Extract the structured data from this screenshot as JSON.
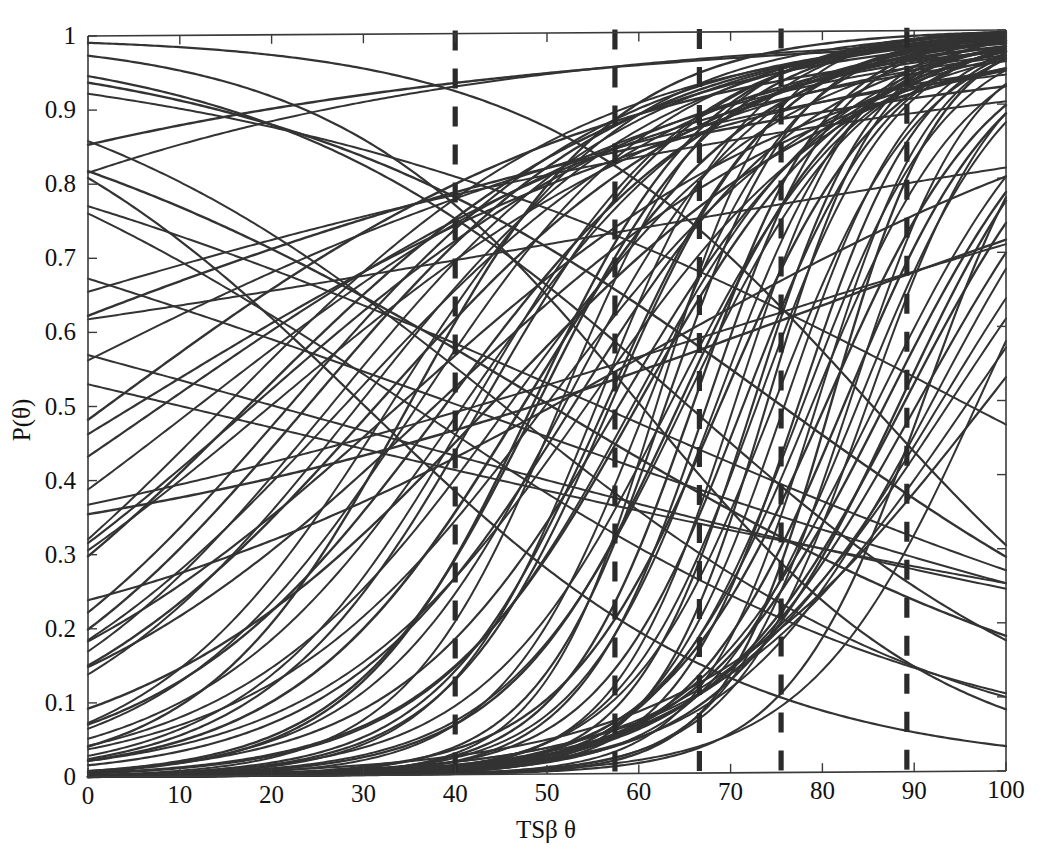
{
  "figure": {
    "name": "item-characteristic-curves",
    "background_color": "#ffffff",
    "curve_color": "#333333",
    "axis_color": "#3a3a3a",
    "cut_line_color": "#2b2b2b"
  },
  "chart_data": {
    "type": "line",
    "title": "",
    "subtitle": "",
    "xlabel": "TSβ θ",
    "ylabel": "P(θ)",
    "xlim": [
      0,
      100
    ],
    "ylim": [
      0,
      1
    ],
    "grid": false,
    "legend": "none",
    "xticks": [
      0,
      10,
      20,
      30,
      40,
      50,
      60,
      70,
      80,
      90,
      100
    ],
    "xticklabels": [
      "0",
      "10",
      "20",
      "30",
      "40",
      "50",
      "60",
      "70",
      "80",
      "90",
      "100"
    ],
    "yticks": [
      0,
      0.1,
      0.2,
      0.3,
      0.4,
      0.5,
      0.6,
      0.7,
      0.8,
      0.9,
      1
    ],
    "yticklabels": [
      "0",
      "0.1",
      "0.2",
      "0.3",
      "0.4",
      "0.5",
      "0.6",
      "0.7",
      "0.8",
      "0.9",
      "1"
    ],
    "annotations": {
      "cut_score_lines": {
        "label": "vertical dashed cut-score lines",
        "x_values": [
          40.0,
          57.4,
          66.6,
          75.5,
          89.2
        ],
        "style": "dashed",
        "color": "#2b2b2b"
      }
    },
    "series_note": "Each series is a two-parameter logistic item characteristic curve P(theta)=c+(1-c)/(1+exp(-a*(theta-b))) over theta in [0,100].",
    "series": [
      {
        "name": "item-1",
        "a": 0.057,
        "b": 22.0,
        "c": 0.0,
        "lw": 2.2
      },
      {
        "name": "item-2",
        "a": 0.062,
        "b": 29.5,
        "c": 0.0,
        "lw": 2.0
      },
      {
        "name": "item-3",
        "a": 0.049,
        "b": 17.5,
        "c": 0.0,
        "lw": 2.4
      },
      {
        "name": "item-4",
        "a": 0.071,
        "b": 41.0,
        "c": 0.0,
        "lw": 2.0
      },
      {
        "name": "item-5",
        "a": 0.08,
        "b": 47.5,
        "c": 0.0,
        "lw": 2.6
      },
      {
        "name": "item-6",
        "a": 0.094,
        "b": 52.0,
        "c": 0.0,
        "lw": 2.0
      },
      {
        "name": "item-7",
        "a": 0.11,
        "b": 56.5,
        "c": 0.0,
        "lw": 2.2
      },
      {
        "name": "item-8",
        "a": 0.125,
        "b": 61.0,
        "c": 0.0,
        "lw": 2.0
      },
      {
        "name": "item-9",
        "a": 0.14,
        "b": 66.0,
        "c": 0.0,
        "lw": 2.4
      },
      {
        "name": "item-10",
        "a": 0.152,
        "b": 70.5,
        "c": 0.0,
        "lw": 2.0
      },
      {
        "name": "item-11",
        "a": 0.165,
        "b": 74.0,
        "c": 0.0,
        "lw": 2.2
      },
      {
        "name": "item-12",
        "a": 0.13,
        "b": 78.0,
        "c": 0.0,
        "lw": 2.0
      },
      {
        "name": "item-13",
        "a": 0.118,
        "b": 82.5,
        "c": 0.0,
        "lw": 2.4
      },
      {
        "name": "item-14",
        "a": 0.1,
        "b": 86.0,
        "c": 0.0,
        "lw": 2.0
      },
      {
        "name": "item-15",
        "a": 0.089,
        "b": 90.5,
        "c": 0.0,
        "lw": 2.2
      },
      {
        "name": "item-16",
        "a": 0.075,
        "b": 94.0,
        "c": 0.0,
        "lw": 2.0
      },
      {
        "name": "item-17",
        "a": 0.044,
        "b": 34.0,
        "c": 0.0,
        "lw": 2.2
      },
      {
        "name": "item-18",
        "a": 0.038,
        "b": 12.0,
        "c": 0.0,
        "lw": 2.0
      },
      {
        "name": "item-19",
        "a": 0.052,
        "b": 44.0,
        "c": 0.0,
        "lw": 2.4
      },
      {
        "name": "item-20",
        "a": 0.065,
        "b": 50.0,
        "c": 0.0,
        "lw": 2.0
      },
      {
        "name": "item-21",
        "a": 0.083,
        "b": 58.0,
        "c": 0.0,
        "lw": 2.2
      },
      {
        "name": "item-22",
        "a": 0.097,
        "b": 63.5,
        "c": 0.0,
        "lw": 2.0
      },
      {
        "name": "item-23",
        "a": 0.115,
        "b": 69.0,
        "c": 0.0,
        "lw": 2.4
      },
      {
        "name": "item-24",
        "a": 0.135,
        "b": 73.0,
        "c": 0.0,
        "lw": 2.0
      },
      {
        "name": "item-25",
        "a": 0.148,
        "b": 77.5,
        "c": 0.0,
        "lw": 2.2
      },
      {
        "name": "item-26",
        "a": 0.122,
        "b": 84.0,
        "c": 0.0,
        "lw": 2.0
      },
      {
        "name": "item-27",
        "a": 0.105,
        "b": 88.5,
        "c": 0.0,
        "lw": 2.4
      },
      {
        "name": "item-28",
        "a": 0.06,
        "b": 26.5,
        "c": 0.0,
        "lw": 2.0
      },
      {
        "name": "item-29",
        "a": 0.046,
        "b": 38.0,
        "c": 0.0,
        "lw": 2.2
      },
      {
        "name": "item-30",
        "a": 0.07,
        "b": 54.5,
        "c": 0.0,
        "lw": 2.0
      },
      {
        "name": "item-31",
        "a": 0.088,
        "b": 60.0,
        "c": 0.0,
        "lw": 2.4
      },
      {
        "name": "item-32",
        "a": 0.102,
        "b": 65.0,
        "c": 0.0,
        "lw": 2.0
      },
      {
        "name": "item-33",
        "a": 0.128,
        "b": 71.5,
        "c": 0.0,
        "lw": 2.2
      },
      {
        "name": "item-34",
        "a": 0.143,
        "b": 76.0,
        "c": 0.0,
        "lw": 2.0
      },
      {
        "name": "item-35",
        "a": 0.112,
        "b": 80.5,
        "c": 0.0,
        "lw": 2.4
      },
      {
        "name": "item-36",
        "a": 0.093,
        "b": 92.0,
        "c": 0.0,
        "lw": 2.0
      },
      {
        "name": "item-37",
        "a": 0.034,
        "b": 8.0,
        "c": 0.0,
        "lw": 2.2
      },
      {
        "name": "item-38",
        "a": 0.041,
        "b": 20.0,
        "c": 0.0,
        "lw": 2.0
      },
      {
        "name": "item-39",
        "a": 0.055,
        "b": 31.5,
        "c": 0.0,
        "lw": 2.4
      },
      {
        "name": "item-40",
        "a": 0.068,
        "b": 46.0,
        "c": 0.0,
        "lw": 2.0
      },
      {
        "name": "item-41",
        "a": 0.078,
        "b": 53.0,
        "c": 0.0,
        "lw": 2.2
      },
      {
        "name": "item-42",
        "a": 0.091,
        "b": 59.5,
        "c": 0.0,
        "lw": 2.0
      },
      {
        "name": "item-43",
        "a": 0.107,
        "b": 64.5,
        "c": 0.0,
        "lw": 2.4
      },
      {
        "name": "item-44",
        "a": 0.132,
        "b": 68.5,
        "c": 0.0,
        "lw": 2.0
      },
      {
        "name": "item-45",
        "a": 0.155,
        "b": 72.5,
        "c": 0.0,
        "lw": 2.2
      },
      {
        "name": "item-46",
        "a": 0.12,
        "b": 79.0,
        "c": 0.0,
        "lw": 2.0
      },
      {
        "name": "item-47",
        "a": 0.098,
        "b": 87.0,
        "c": 0.0,
        "lw": 2.4
      },
      {
        "name": "item-48",
        "a": 0.072,
        "b": 96.0,
        "c": 0.0,
        "lw": 2.0
      },
      {
        "name": "item-49",
        "a": -0.048,
        "b": 30.0,
        "c": 0.0,
        "lw": 2.2
      },
      {
        "name": "item-50",
        "a": -0.04,
        "b": 45.0,
        "c": 0.0,
        "lw": 2.0
      },
      {
        "name": "item-51",
        "a": -0.03,
        "b": 50.0,
        "c": 0.0,
        "lw": 2.4
      },
      {
        "name": "item-52",
        "a": -0.022,
        "b": 55.0,
        "c": 0.0,
        "lw": 2.0
      },
      {
        "name": "item-53",
        "a": -0.06,
        "b": 60.0,
        "c": 0.0,
        "lw": 2.2
      },
      {
        "name": "item-54",
        "a": -0.018,
        "b": 40.0,
        "c": 0.0,
        "lw": 2.0
      },
      {
        "name": "item-55",
        "a": -0.036,
        "b": 75.0,
        "c": 0.0,
        "lw": 2.4
      },
      {
        "name": "item-56",
        "a": -0.014,
        "b": 20.0,
        "c": 0.0,
        "lw": 2.0
      },
      {
        "name": "item-57",
        "a": 0.03,
        "b": 5.0,
        "c": 0.0,
        "lw": 2.2
      },
      {
        "name": "item-58",
        "a": 0.025,
        "b": -10.0,
        "c": 0.0,
        "lw": 2.0
      },
      {
        "name": "item-59",
        "a": 0.02,
        "b": -25.0,
        "c": 0.0,
        "lw": 2.4
      },
      {
        "name": "item-60",
        "a": 0.016,
        "b": -40.0,
        "c": 0.0,
        "lw": 2.0
      },
      {
        "name": "item-61",
        "a": 0.145,
        "b": 67.5,
        "c": 0.0,
        "lw": 2.2
      },
      {
        "name": "item-62",
        "a": 0.16,
        "b": 62.0,
        "c": 0.0,
        "lw": 2.0
      },
      {
        "name": "item-63",
        "a": 0.17,
        "b": 81.0,
        "c": 0.0,
        "lw": 2.4
      },
      {
        "name": "item-64",
        "a": 0.138,
        "b": 85.0,
        "c": 0.0,
        "lw": 2.0
      },
      {
        "name": "item-65",
        "a": 0.086,
        "b": 43.0,
        "c": 0.0,
        "lw": 2.2
      },
      {
        "name": "item-66",
        "a": 0.074,
        "b": 36.0,
        "c": 0.0,
        "lw": 2.0
      },
      {
        "name": "item-67",
        "a": 0.058,
        "b": 24.0,
        "c": 0.0,
        "lw": 2.4
      },
      {
        "name": "item-68",
        "a": 0.05,
        "b": 15.0,
        "c": 0.0,
        "lw": 2.0
      },
      {
        "name": "item-69",
        "a": 0.113,
        "b": 57.0,
        "c": 0.0,
        "lw": 2.2
      },
      {
        "name": "item-70",
        "a": 0.126,
        "b": 74.8,
        "c": 0.0,
        "lw": 2.0
      },
      {
        "name": "item-71",
        "a": 0.095,
        "b": 89.0,
        "c": 0.0,
        "lw": 2.4
      },
      {
        "name": "item-72",
        "a": 0.081,
        "b": 93.0,
        "c": 0.0,
        "lw": 2.0
      },
      {
        "name": "item-73",
        "a": 0.063,
        "b": 98.0,
        "c": 0.0,
        "lw": 2.2
      },
      {
        "name": "item-74",
        "a": 0.027,
        "b": -55.0,
        "c": 0.0,
        "lw": 2.0
      },
      {
        "name": "item-75",
        "a": 0.022,
        "b": -80.0,
        "c": 0.0,
        "lw": 2.4
      },
      {
        "name": "item-76",
        "a": -0.026,
        "b": 95.0,
        "c": 0.0,
        "lw": 2.0
      },
      {
        "name": "item-77",
        "a": -0.055,
        "b": 85.0,
        "c": 0.0,
        "lw": 2.2
      },
      {
        "name": "item-78",
        "a": -0.012,
        "b": 10.0,
        "c": 0.0,
        "lw": 2.0
      },
      {
        "name": "item-79",
        "a": 0.104,
        "b": 48.5,
        "c": 0.0,
        "lw": 2.4
      },
      {
        "name": "item-80",
        "a": 0.117,
        "b": 51.5,
        "c": 0.0,
        "lw": 2.0
      },
      {
        "name": "item-81",
        "a": 0.137,
        "b": 91.0,
        "c": 0.0,
        "lw": 2.2
      },
      {
        "name": "item-82",
        "a": 0.15,
        "b": 83.0,
        "c": 0.0,
        "lw": 2.0
      },
      {
        "name": "item-83",
        "a": 0.066,
        "b": 39.0,
        "c": 0.0,
        "lw": 2.4
      },
      {
        "name": "item-84",
        "a": 0.053,
        "b": 28.0,
        "c": 0.0,
        "lw": 2.0
      },
      {
        "name": "item-85",
        "a": 0.043,
        "b": 18.0,
        "c": 0.0,
        "lw": 2.2
      },
      {
        "name": "item-86",
        "a": 0.108,
        "b": 97.0,
        "c": 0.0,
        "lw": 2.0
      },
      {
        "name": "item-87",
        "a": 0.09,
        "b": 35.0,
        "c": 0.0,
        "lw": 2.4
      },
      {
        "name": "item-88",
        "a": 0.077,
        "b": 33.0,
        "c": 0.0,
        "lw": 2.0
      },
      {
        "name": "item-89",
        "a": -0.044,
        "b": 65.0,
        "c": 0.0,
        "lw": 2.2
      },
      {
        "name": "item-90",
        "a": -0.033,
        "b": 35.0,
        "c": 0.0,
        "lw": 2.0
      },
      {
        "name": "item-91",
        "a": 0.036,
        "b": 2.0,
        "c": 0.0,
        "lw": 2.4
      },
      {
        "name": "item-92",
        "a": 0.158,
        "b": 79.5,
        "c": 0.0,
        "lw": 2.0
      },
      {
        "name": "item-93",
        "a": 0.141,
        "b": 63.0,
        "c": 0.0,
        "lw": 2.2
      },
      {
        "name": "item-94",
        "a": 0.123,
        "b": 55.5,
        "c": 0.0,
        "lw": 2.0
      },
      {
        "name": "item-95",
        "a": 0.099,
        "b": 49.0,
        "c": 0.0,
        "lw": 2.4
      },
      {
        "name": "item-96",
        "a": 0.084,
        "b": 42.0,
        "c": 0.0,
        "lw": 2.0
      },
      {
        "name": "item-97",
        "a": 0.031,
        "b": 60.0,
        "c": 0.12,
        "lw": 2.2
      },
      {
        "name": "item-98",
        "a": 0.019,
        "b": 70.0,
        "c": 0.2,
        "lw": 2.0
      },
      {
        "name": "item-99",
        "a": 0.024,
        "b": 80.0,
        "c": 0.26,
        "lw": 2.4
      },
      {
        "name": "item-100",
        "a": 0.015,
        "b": 55.0,
        "c": 0.45,
        "lw": 2.0
      }
    ]
  }
}
